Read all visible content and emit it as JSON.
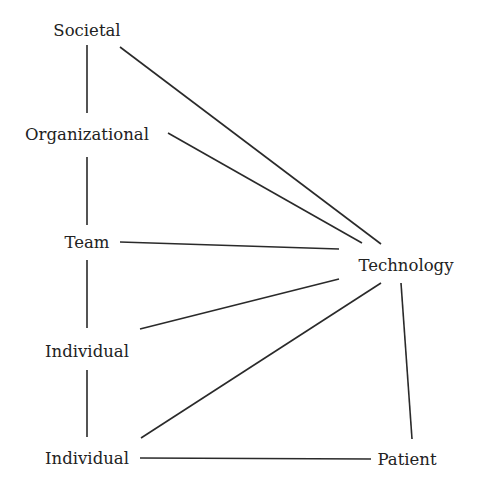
{
  "diagram": {
    "type": "network",
    "nodes": [
      {
        "id": "societal",
        "label": "Societal",
        "x": 87,
        "y": 31
      },
      {
        "id": "organizational",
        "label": "Organizational",
        "x": 87,
        "y": 135
      },
      {
        "id": "team",
        "label": "Team",
        "x": 87,
        "y": 243
      },
      {
        "id": "individual_1",
        "label": "Individual",
        "x": 87,
        "y": 352
      },
      {
        "id": "individual_2",
        "label": "Individual",
        "x": 87,
        "y": 459
      },
      {
        "id": "technology",
        "label": "Technology",
        "x": 406,
        "y": 266
      },
      {
        "id": "patient",
        "label": "Patient",
        "x": 407,
        "y": 460
      }
    ],
    "edges": [
      {
        "from": "societal",
        "to": "organizational",
        "x1": 87,
        "y1": 45,
        "x2": 87,
        "y2": 113
      },
      {
        "from": "organizational",
        "to": "team",
        "x1": 87,
        "y1": 157,
        "x2": 87,
        "y2": 225
      },
      {
        "from": "team",
        "to": "individual_1",
        "x1": 87,
        "y1": 260,
        "x2": 87,
        "y2": 328
      },
      {
        "from": "individual_1",
        "to": "individual_2",
        "x1": 87,
        "y1": 370,
        "x2": 87,
        "y2": 437
      },
      {
        "from": "societal",
        "to": "technology",
        "x1": 120,
        "y1": 47,
        "x2": 381,
        "y2": 244
      },
      {
        "from": "organizational",
        "to": "technology",
        "x1": 168,
        "y1": 133,
        "x2": 362,
        "y2": 243
      },
      {
        "from": "team",
        "to": "technology",
        "x1": 120,
        "y1": 242,
        "x2": 339,
        "y2": 249
      },
      {
        "from": "individual_1",
        "to": "technology",
        "x1": 140,
        "y1": 329,
        "x2": 339,
        "y2": 279
      },
      {
        "from": "individual_2",
        "to": "technology",
        "x1": 141,
        "y1": 438,
        "x2": 381,
        "y2": 283
      },
      {
        "from": "technology",
        "to": "patient",
        "x1": 401,
        "y1": 283,
        "x2": 412,
        "y2": 439
      },
      {
        "from": "individual_2",
        "to": "patient",
        "x1": 140,
        "y1": 458,
        "x2": 371,
        "y2": 459
      }
    ]
  },
  "labels": {
    "societal": "Societal",
    "organizational": "Organizational",
    "team": "Team",
    "individual_1": "Individual",
    "individual_2": "Individual",
    "technology": "Technology",
    "patient": "Patient"
  }
}
